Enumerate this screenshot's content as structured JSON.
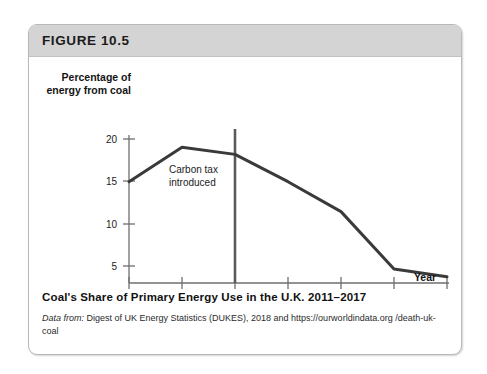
{
  "figure": {
    "number_label": "FIGURE 10.5",
    "caption_title": "Coal's Share of Primary Energy Use in the U.K. 2011–2017",
    "source_lead": "Data from:",
    "source_text": " Digest of UK Energy Statistics (DUKES), 2018 and https://ourworldindata.org /death-uk-coal"
  },
  "colors": {
    "header_bar": "#d4d4d4",
    "card_border": "#b8b8b8",
    "line": "#3a3a3a",
    "axis": "#6f6f6f",
    "text": "#141414"
  },
  "chart_data": {
    "type": "line",
    "title": "Coal's Share of Primary Energy Use in the U.K. 2011–2017",
    "xlabel": "Year",
    "ylabel": "Percentage of energy from coal",
    "x": [
      2011,
      2012,
      2013,
      2014,
      2015,
      2016,
      2017
    ],
    "values": [
      15.7,
      19.6,
      18.8,
      15.7,
      12.3,
      5.8,
      4.9
    ],
    "xtick_labels": [
      "2011",
      "2012",
      "2013",
      "2014",
      "2015",
      "2016",
      "2017"
    ],
    "ytick_labels": [
      "5",
      "10",
      "15",
      "20"
    ],
    "yticks": [
      5,
      10,
      15,
      20
    ],
    "xlim": [
      2011,
      2017
    ],
    "ylim": [
      4.2,
      21.0
    ],
    "grid": false,
    "legend": null,
    "annotations": [
      {
        "text": "Carbon tax introduced",
        "line1": "Carbon tax",
        "line2": "introduced",
        "x": 2013,
        "type": "vertical-line-with-label"
      }
    ]
  }
}
